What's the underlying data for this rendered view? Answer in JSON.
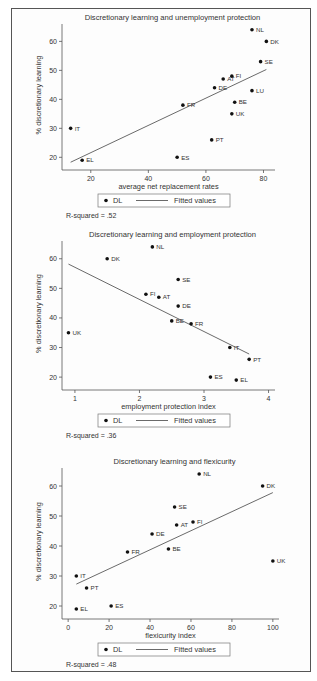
{
  "figure": {
    "border_color": "#555555",
    "point_color": "#111111",
    "line_color": "#444444"
  },
  "legend": {
    "marker_label": "DL",
    "line_label": "Fitted values"
  },
  "chart_data": [
    {
      "type": "scatter",
      "title": "Discretionary learning and unemployment protection",
      "xlabel": "average net replacement rates",
      "ylabel": "% discretionary learning",
      "xlim": [
        10,
        84
      ],
      "ylim": [
        17,
        66
      ],
      "xticks": [
        20,
        40,
        60,
        80
      ],
      "yticks": [
        20,
        30,
        40,
        50,
        60
      ],
      "grid": false,
      "legend_position": "bottom",
      "r_squared_label": "R-squared = .52",
      "series": [
        {
          "name": "DL",
          "points": [
            {
              "label": "NL",
              "x": 76,
              "y": 64
            },
            {
              "label": "DK",
              "x": 81,
              "y": 60
            },
            {
              "label": "SE",
              "x": 79,
              "y": 53
            },
            {
              "label": "FI",
              "x": 69,
              "y": 48
            },
            {
              "label": "AT",
              "x": 66,
              "y": 47
            },
            {
              "label": "DE",
              "x": 63,
              "y": 44
            },
            {
              "label": "LU",
              "x": 76,
              "y": 43
            },
            {
              "label": "BE",
              "x": 70,
              "y": 39
            },
            {
              "label": "UK",
              "x": 69,
              "y": 35
            },
            {
              "label": "FR",
              "x": 52,
              "y": 38
            },
            {
              "label": "IT",
              "x": 13,
              "y": 30
            },
            {
              "label": "PT",
              "x": 62,
              "y": 26
            },
            {
              "label": "ES",
              "x": 50,
              "y": 20
            },
            {
              "label": "EL",
              "x": 17,
              "y": 19
            }
          ]
        },
        {
          "name": "Fitted values",
          "line": [
            {
              "x": 13,
              "y": 18.3
            },
            {
              "x": 81,
              "y": 50.3
            }
          ]
        }
      ]
    },
    {
      "type": "scatter",
      "title": "Discretionary learning and employment protection",
      "xlabel": "employment protection index",
      "ylabel": "% discretionary learning",
      "xlim": [
        0.8,
        4.1
      ],
      "ylim": [
        17,
        66
      ],
      "xticks": [
        1,
        2,
        3,
        4
      ],
      "yticks": [
        20,
        30,
        40,
        50,
        60
      ],
      "grid": false,
      "legend_position": "bottom",
      "r_squared_label": "R-squared = .36",
      "series": [
        {
          "name": "DL",
          "points": [
            {
              "label": "NL",
              "x": 2.2,
              "y": 64
            },
            {
              "label": "DK",
              "x": 1.5,
              "y": 60
            },
            {
              "label": "SE",
              "x": 2.6,
              "y": 53
            },
            {
              "label": "FI",
              "x": 2.1,
              "y": 48
            },
            {
              "label": "AT",
              "x": 2.3,
              "y": 47
            },
            {
              "label": "DE",
              "x": 2.6,
              "y": 44
            },
            {
              "label": "BE",
              "x": 2.5,
              "y": 39
            },
            {
              "label": "FR",
              "x": 2.8,
              "y": 38
            },
            {
              "label": "UK",
              "x": 0.9,
              "y": 35
            },
            {
              "label": "IT",
              "x": 3.4,
              "y": 30
            },
            {
              "label": "PT",
              "x": 3.7,
              "y": 26
            },
            {
              "label": "ES",
              "x": 3.1,
              "y": 20
            },
            {
              "label": "EL",
              "x": 3.5,
              "y": 19
            }
          ]
        },
        {
          "name": "Fitted values",
          "line": [
            {
              "x": 0.9,
              "y": 58.2
            },
            {
              "x": 3.7,
              "y": 27.8
            }
          ]
        }
      ]
    },
    {
      "type": "scatter",
      "title": "Discretionary learning and flexicurity",
      "xlabel": "flexicurity index",
      "ylabel": "% discretionary learning",
      "xlim": [
        -3,
        103
      ],
      "ylim": [
        17,
        66
      ],
      "xticks": [
        0,
        20,
        40,
        60,
        80,
        100
      ],
      "yticks": [
        20,
        30,
        40,
        50,
        60
      ],
      "grid": false,
      "legend_position": "bottom",
      "r_squared_label": "R-squared = .48",
      "series": [
        {
          "name": "DL",
          "points": [
            {
              "label": "NL",
              "x": 64,
              "y": 64
            },
            {
              "label": "DK",
              "x": 95,
              "y": 60
            },
            {
              "label": "SE",
              "x": 52,
              "y": 53
            },
            {
              "label": "FI",
              "x": 61,
              "y": 48
            },
            {
              "label": "AT",
              "x": 53,
              "y": 47
            },
            {
              "label": "DE",
              "x": 41,
              "y": 44
            },
            {
              "label": "FR",
              "x": 29,
              "y": 38
            },
            {
              "label": "BE",
              "x": 49,
              "y": 39
            },
            {
              "label": "UK",
              "x": 100,
              "y": 35
            },
            {
              "label": "IT",
              "x": 4,
              "y": 30
            },
            {
              "label": "PT",
              "x": 9,
              "y": 26
            },
            {
              "label": "ES",
              "x": 21,
              "y": 20
            },
            {
              "label": "EL",
              "x": 4,
              "y": 19
            }
          ]
        },
        {
          "name": "Fitted values",
          "line": [
            {
              "x": 4,
              "y": 27.3
            },
            {
              "x": 100,
              "y": 57.8
            }
          ]
        }
      ]
    }
  ]
}
